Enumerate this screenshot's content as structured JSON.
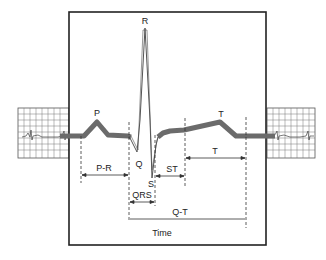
{
  "diagram": {
    "wave_labels": {
      "p": "P",
      "q": "Q",
      "r": "R",
      "s": "S",
      "t": "T"
    },
    "interval_labels": {
      "pr": "P-R",
      "qrs": "QRS",
      "st": "ST",
      "t": "T",
      "qt": "Q-T"
    },
    "axis_label": "Time",
    "colors": {
      "trace": "#6b6b6b",
      "frame": "#222222",
      "grid": "#555555",
      "text": "#222222"
    }
  }
}
